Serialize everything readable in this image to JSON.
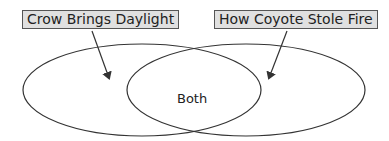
{
  "diagram": {
    "type": "venn",
    "sets": [
      {
        "id": "left",
        "label": "Crow Brings Daylight"
      },
      {
        "id": "right",
        "label": "How Coyote Stole Fire"
      }
    ],
    "intersection_label": "Both",
    "colors": {
      "box_fill": "#e0e0e0",
      "box_border": "#555555",
      "stroke": "#333333",
      "text": "#222222"
    }
  }
}
